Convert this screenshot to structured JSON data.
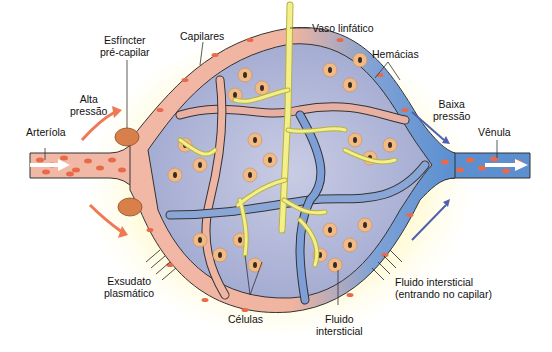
{
  "labels": {
    "esfincter": [
      "Esfíncter",
      "pré-capilar"
    ],
    "capilares": "Capilares",
    "vaso_linfatico": "Vaso linfático",
    "hemacias": "Hemácias",
    "alta_pressao": [
      "Alta",
      "pressão"
    ],
    "baixa_pressao": [
      "Baixa",
      "pressão"
    ],
    "arteriola": "Arteríola",
    "venula": "Vênula",
    "exsudato": [
      "Exsudato",
      "plasmático"
    ],
    "celulas": "Células",
    "fluido_intersticial": [
      "Fluido",
      "intersticial"
    ],
    "fluido_entrando": [
      "Fluido intersticial",
      "(entrando no capilar)"
    ]
  },
  "colors": {
    "arterial_vessel": "#f2b8a6",
    "venous_vessel": "#5b8fd0",
    "red_cell": "#e86a4a",
    "lymphatic": "#f3ef8a",
    "tissue": "#aeb4d6",
    "cell": "#f1bb86",
    "nucleus": "#3a2a22",
    "sphincter": "#d9804a",
    "arrow_high": "#ee7a55",
    "arrow_low": "#5060b0",
    "halo": "#fffbd0"
  }
}
